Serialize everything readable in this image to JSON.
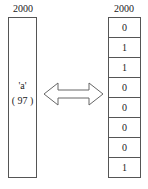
{
  "left": {
    "address": "2000",
    "char": "'a'",
    "code": "( 97 )"
  },
  "right": {
    "address": "2000",
    "bits": [
      "0",
      "1",
      "1",
      "0",
      "0",
      "0",
      "0",
      "1"
    ]
  },
  "arrow": {
    "type": "double-headed",
    "icon": "double-arrow-icon"
  }
}
